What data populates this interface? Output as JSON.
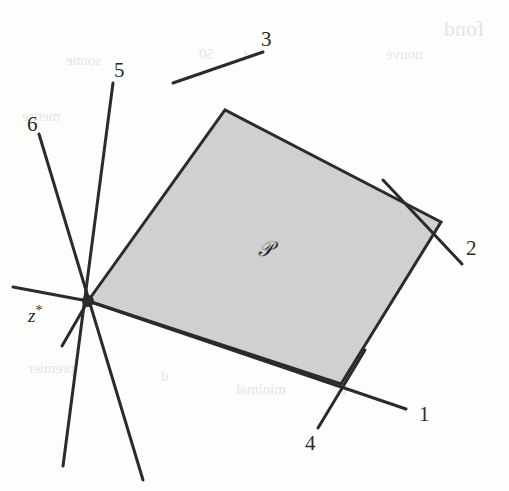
{
  "figure": {
    "kind": "geometry-diagram",
    "background_color": "#fdfdfc",
    "ink_color": "#2b2b2b",
    "fill_color": "#d0d0d0",
    "stroke_width": 3
  },
  "chart_data": {
    "type": "scatter",
    "title": "",
    "xlabel": "",
    "ylabel": "",
    "xlim": [
      0,
      509
    ],
    "ylim": [
      0,
      491
    ],
    "grid": false,
    "legend": "none",
    "polygon": {
      "name": "P",
      "fill": "#d0d0d0",
      "stroke": "#2b2b2b",
      "vertices": [
        [
          88,
          301
        ],
        [
          225,
          110
        ],
        [
          441,
          222
        ],
        [
          341,
          384
        ]
      ]
    },
    "vertex_point": {
      "label": "z*",
      "x": 88,
      "y": 301,
      "radius": 6
    },
    "lines": [
      {
        "label": "1",
        "x1": 88,
        "y1": 301,
        "x2": 406,
        "y2": 409,
        "label_x": 419,
        "label_y": 402
      },
      {
        "label": "2",
        "x1": 383,
        "y1": 180,
        "x2": 462,
        "y2": 264,
        "label_x": 466,
        "label_y": 236
      },
      {
        "label": "3",
        "x1": 263,
        "y1": 52,
        "x2": 173,
        "y2": 83,
        "label_x": 261,
        "label_y": 27
      },
      {
        "label": "4",
        "x1": 365,
        "y1": 350,
        "x2": 318,
        "y2": 428,
        "label_x": 305,
        "label_y": 431
      },
      {
        "label": "5",
        "x1": 113,
        "y1": 83,
        "x2": 63,
        "y2": 466,
        "label_x": 114,
        "label_y": 58
      },
      {
        "label": "6",
        "x1": 39,
        "y1": 134,
        "x2": 143,
        "y2": 480,
        "label_x": 27,
        "label_y": 112
      }
    ],
    "extra_segments": [
      {
        "name": "hyperplane-1-left-stub",
        "x1": 88,
        "y1": 301,
        "x2": 13,
        "y2": 287
      },
      {
        "name": "hyperplane-2-left-stub",
        "x1": 88,
        "y1": 301,
        "x2": 62,
        "y2": 346
      }
    ]
  },
  "labels": {
    "line_1": "1",
    "line_2": "2",
    "line_3": "3",
    "line_4": "4",
    "line_5": "5",
    "line_6": "6",
    "polygon": "𝒫",
    "vertex": "z",
    "vertex_superscript": "*"
  },
  "page_bleedthrough": [
    {
      "text": "fond",
      "x": 444,
      "y": 16,
      "size": 22
    },
    {
      "text": "sonne",
      "x": 66,
      "y": 52,
      "size": 15
    },
    {
      "text": "50",
      "x": 199,
      "y": 46,
      "size": 15
    },
    {
      "text": "4",
      "x": 243,
      "y": 48,
      "size": 15
    },
    {
      "text": "nouve",
      "x": 386,
      "y": 46,
      "size": 15
    },
    {
      "text": "mettre",
      "x": 22,
      "y": 108,
      "size": 15
    },
    {
      "text": "10",
      "x": 304,
      "y": 359,
      "size": 15
    },
    {
      "text": "premier",
      "x": 28,
      "y": 360,
      "size": 15
    },
    {
      "text": "d",
      "x": 161,
      "y": 368,
      "size": 15
    },
    {
      "text": "minimal",
      "x": 236,
      "y": 381,
      "size": 15
    },
    {
      "text": "W",
      "x": 334,
      "y": 383,
      "size": 15
    }
  ]
}
